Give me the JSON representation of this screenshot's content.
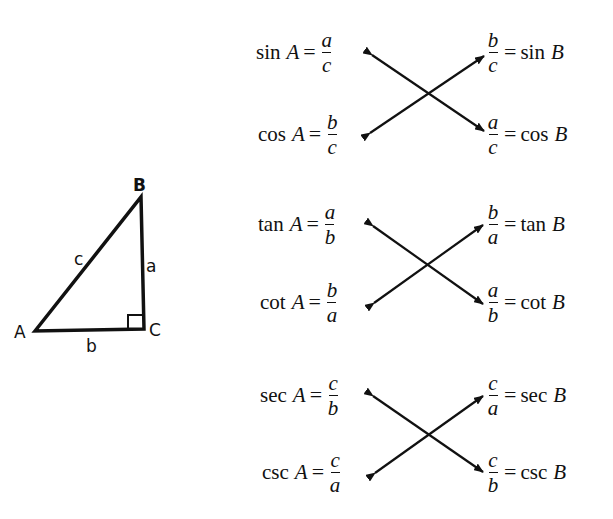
{
  "triangle": {
    "vertices": {
      "A": "A",
      "B": "B",
      "C": "C"
    },
    "sides": {
      "a": "a",
      "b": "b",
      "c": "c"
    },
    "right_angle_at": "C"
  },
  "groups": [
    {
      "left": [
        {
          "fn": "sin",
          "var": "A",
          "eq": "=",
          "num": "a",
          "den": "c"
        },
        {
          "fn": "cos",
          "var": "A",
          "eq": "=",
          "num": "b",
          "den": "c"
        }
      ],
      "right": [
        {
          "fn": "sin",
          "var": "B",
          "eq": "=",
          "num": "b",
          "den": "c"
        },
        {
          "fn": "cos",
          "var": "B",
          "eq": "=",
          "num": "a",
          "den": "c"
        }
      ]
    },
    {
      "left": [
        {
          "fn": "tan",
          "var": "A",
          "eq": "=",
          "num": "a",
          "den": "b"
        },
        {
          "fn": "cot",
          "var": "A",
          "eq": "=",
          "num": "b",
          "den": "a"
        }
      ],
      "right": [
        {
          "fn": "tan",
          "var": "B",
          "eq": "=",
          "num": "b",
          "den": "a"
        },
        {
          "fn": "cot",
          "var": "B",
          "eq": "=",
          "num": "a",
          "den": "b"
        }
      ]
    },
    {
      "left": [
        {
          "fn": "sec",
          "var": "A",
          "eq": "=",
          "num": "c",
          "den": "b"
        },
        {
          "fn": "csc",
          "var": "A",
          "eq": "=",
          "num": "c",
          "den": "a"
        }
      ],
      "right": [
        {
          "fn": "sec",
          "var": "B",
          "eq": "=",
          "num": "c",
          "den": "a"
        },
        {
          "fn": "csc",
          "var": "B",
          "eq": "=",
          "num": "c",
          "den": "b"
        }
      ]
    }
  ]
}
